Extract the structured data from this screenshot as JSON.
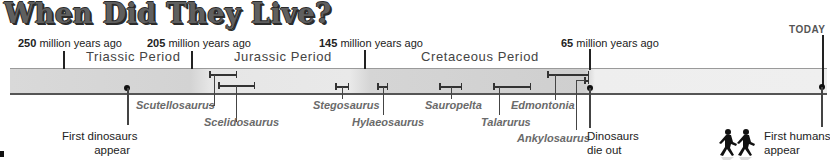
{
  "title": "When Did They Live?",
  "time_markers": [
    {
      "value": "250",
      "suffix": " million years ago"
    },
    {
      "value": "205",
      "suffix": " million years ago"
    },
    {
      "value": "145",
      "suffix": " million years ago"
    },
    {
      "value": "65",
      "suffix": " million years ago"
    },
    {
      "value": "TODAY",
      "suffix": ""
    }
  ],
  "periods": [
    {
      "name": "Triassic Period"
    },
    {
      "name": "Jurassic Period"
    },
    {
      "name": "Cretaceous Period"
    }
  ],
  "species": [
    {
      "name": "Scutellosaurus"
    },
    {
      "name": "Scelidosaurus"
    },
    {
      "name": "Stegosaurus"
    },
    {
      "name": "Hylaeosaurus"
    },
    {
      "name": "Sauropelta"
    },
    {
      "name": "Talarurus"
    },
    {
      "name": "Edmontonia"
    },
    {
      "name": "Ankylosaurus"
    }
  ],
  "events": [
    {
      "line1": "First dinosaurs",
      "line2": "appear"
    },
    {
      "line1": "Dinosaurs",
      "line2": "die out"
    },
    {
      "line1": "First humans",
      "line2": "appear"
    }
  ],
  "colors": {
    "title": "#5f5f5f",
    "bar": "#d5d5d5",
    "species_label": "#6a6a6a",
    "text": "#222222"
  },
  "icons": [
    "walking-humans-icon"
  ]
}
